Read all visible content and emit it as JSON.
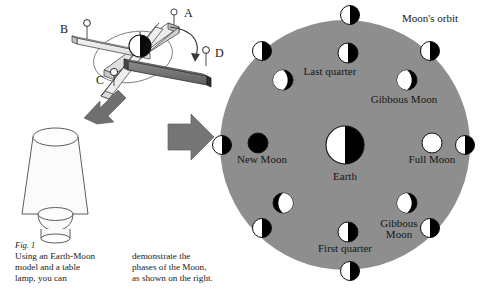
{
  "figure": {
    "number": "Fig. 1",
    "caption_column_1": "Using an Earth-Moon\nmodel and a table\nlamp, you can",
    "caption_column_2": "demonstrate the\nphases of the Moon,\nas shown on the right."
  },
  "model": {
    "title": "earth-moon-model",
    "ball_labels": [
      "A",
      "B",
      "C",
      "D"
    ],
    "center_body": "Earth ball",
    "rotation_arrow": "curved-rotation-arrow",
    "light_arrow": "light-direction-arrow",
    "lamp": "table lamp"
  },
  "transition": {
    "arrow": "right-arrow"
  },
  "orbit_diagram": {
    "orbit_label": "Moon's orbit",
    "earth_label": "Earth",
    "labels": [
      {
        "text": "Last quarter",
        "x": 330,
        "y": 72
      },
      {
        "text": "Gibbous Moon",
        "x": 404,
        "y": 100
      },
      {
        "text": "New Moon",
        "x": 258,
        "y": 160
      },
      {
        "text": "Full Moon",
        "x": 432,
        "y": 160
      },
      {
        "text": "Gibbous Moon",
        "x": 404,
        "y": 228
      },
      {
        "text": "First quarter",
        "x": 344,
        "y": 246
      }
    ],
    "orbit_moons": [
      {
        "name": "orbit-moon-top",
        "x": 350,
        "y": 15,
        "r": 9.5,
        "phase": "half-lit-left"
      },
      {
        "name": "orbit-moon-upper-right",
        "x": 430,
        "y": 51,
        "r": 9.5,
        "phase": "half-lit-left"
      },
      {
        "name": "orbit-moon-right",
        "x": 465,
        "y": 145,
        "r": 9.5,
        "phase": "half-lit-left"
      },
      {
        "name": "orbit-moon-lower-right",
        "x": 430,
        "y": 228,
        "r": 9.5,
        "phase": "half-lit-left"
      },
      {
        "name": "orbit-moon-bottom",
        "x": 350,
        "y": 271,
        "r": 9.5,
        "phase": "half-lit-left"
      },
      {
        "name": "orbit-moon-lower-left",
        "x": 262,
        "y": 228,
        "r": 9.5,
        "phase": "half-lit-left"
      },
      {
        "name": "orbit-moon-left",
        "x": 222,
        "y": 145,
        "r": 9.5,
        "phase": "half-lit-left"
      },
      {
        "name": "orbit-moon-upper-left",
        "x": 262,
        "y": 51,
        "r": 9.5,
        "phase": "half-lit-left"
      }
    ],
    "phase_moons": [
      {
        "name": "phase-last-quarter",
        "x": 348,
        "y": 53,
        "r": 10,
        "phase": "half-lit-left"
      },
      {
        "name": "phase-gibbous-waning",
        "x": 407,
        "y": 80,
        "r": 10,
        "phase": "gibbous-lit-left"
      },
      {
        "name": "phase-full-moon",
        "x": 432,
        "y": 143,
        "r": 10,
        "phase": "full-lit"
      },
      {
        "name": "phase-gibbous-waxing",
        "x": 407,
        "y": 203,
        "r": 10,
        "phase": "gibbous-lit-left"
      },
      {
        "name": "phase-first-quarter",
        "x": 348,
        "y": 232,
        "r": 10,
        "phase": "half-lit-left"
      },
      {
        "name": "phase-crescent-waxing",
        "x": 283,
        "y": 203,
        "r": 10,
        "phase": "crescent-lit-right"
      },
      {
        "name": "phase-new-moon",
        "x": 258,
        "y": 143,
        "r": 10,
        "phase": "new-dark"
      },
      {
        "name": "phase-crescent-waning",
        "x": 283,
        "y": 80,
        "r": 10,
        "phase": "crescent-lit-left"
      }
    ],
    "earth": {
      "x": 345,
      "y": 145,
      "r": 19,
      "phase": "half-lit-left"
    },
    "disc": {
      "cx": 345,
      "cy": 145,
      "r": 125,
      "fill": "#8e8e8e"
    }
  },
  "colors": {
    "disc_gray": "#8e8e8e",
    "lit": "#ffffff",
    "dark": "#000000",
    "arrow_gray": "#6e6e6e",
    "stroke": "#222222"
  }
}
